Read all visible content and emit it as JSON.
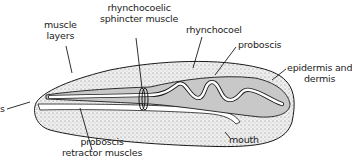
{
  "diagram": {
    "colors": {
      "outline": "#1a1a1a",
      "epidermis_stipple": "#e2e2e2",
      "rhynchocoel_fill": "#c8c8c8",
      "proboscis_fill": "#ffffff",
      "background": "#ffffff"
    },
    "labels": {
      "muscle_layers": [
        "muscle",
        "layers"
      ],
      "sphincter": [
        "rhynchocoelic",
        "sphincter muscle"
      ],
      "rhynchocoel": "rhynchocoel",
      "proboscis": "proboscis",
      "epidermis": [
        "epidermis and",
        "dermis"
      ],
      "mouth": "mouth",
      "retractor": [
        "proboscis",
        "retractor muscles"
      ],
      "left_cut": "s"
    }
  }
}
